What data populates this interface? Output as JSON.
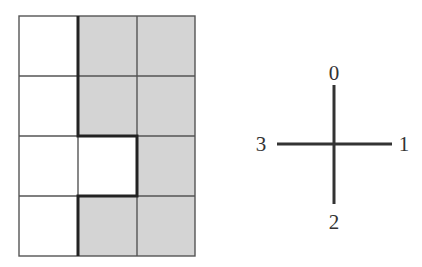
{
  "grid": {
    "rows": 4,
    "cols": 3,
    "origin": [
      19,
      16
    ],
    "cell_w": 58.7,
    "cell_h": 60,
    "shade_color": "#d4d4d4",
    "line_color": "#555555",
    "thick_color": "#222222",
    "cells": [
      [
        "white",
        "gray",
        "gray"
      ],
      [
        "white",
        "gray",
        "gray"
      ],
      [
        "white",
        "white",
        "gray"
      ],
      [
        "white",
        "gray",
        "gray"
      ]
    ]
  },
  "cross": {
    "center": [
      334,
      144
    ],
    "line_color": "#333333",
    "labels": {
      "up": "0",
      "right": "1",
      "down": "2",
      "left": "3"
    }
  }
}
